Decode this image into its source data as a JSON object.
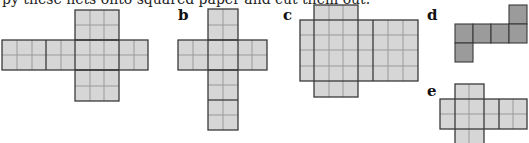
{
  "caption": "py these nets onto squared paper and cut them out.",
  "colors": {
    "light_fill": "#d6d6d6",
    "dark_fill": "#9b9b9b",
    "grid_line": "#9a9a9a",
    "edge_line": "#3a3a3a"
  },
  "nets": [
    {
      "id": "a",
      "label": "",
      "description": "Cuboid net 3x2x2 (cross shape, horizontal strip)"
    },
    {
      "id": "b",
      "label": "b",
      "description": "Cuboid net 2x2x4 (cross shape, vertical strip)"
    },
    {
      "id": "c",
      "label": "c",
      "description": "Cuboid net 3x1x4"
    },
    {
      "id": "d",
      "label": "d",
      "description": "Cube net (six unit squares, dark)"
    },
    {
      "id": "e",
      "label": "e",
      "description": "Cuboid net 2x1x2"
    }
  ]
}
